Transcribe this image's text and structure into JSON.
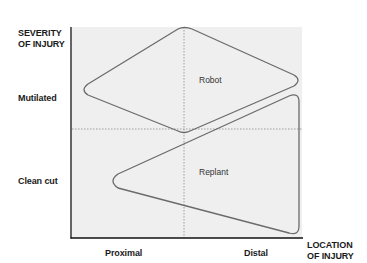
{
  "diagram": {
    "y_axis": {
      "title_line1": "SEVERITY",
      "title_line2": "OF INJURY",
      "levels": [
        "Mutilated",
        "Clean cut"
      ]
    },
    "x_axis": {
      "title_line1": "LOCATION",
      "title_line2": "OF INJURY",
      "levels": [
        "Proximal",
        "Distal"
      ]
    },
    "regions": [
      {
        "label": "Robot",
        "description": "Mutilated severity spanning proximal to distal, centered near the severity divider"
      },
      {
        "label": "Replant",
        "description": "Clean cut severity, widening toward distal location"
      }
    ],
    "colors": {
      "plot_background": "#efefef",
      "shape_stroke": "#6b6b6b",
      "axis": "#111111",
      "divider": "#8a8a8a"
    }
  }
}
